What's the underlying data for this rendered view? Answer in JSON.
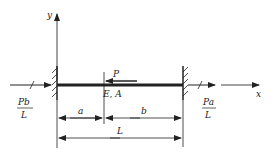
{
  "diagram": {
    "type": "axially loaded bar fixed at both ends",
    "axes": {
      "x_label": "x",
      "y_label": "y"
    },
    "bar": {
      "properties_label": "E, A"
    },
    "load": {
      "label": "P",
      "direction": "left"
    },
    "reactions": {
      "left": {
        "numerator": "Pb",
        "denominator": "L"
      },
      "right": {
        "numerator": "Pa",
        "denominator": "L"
      }
    },
    "dimensions": {
      "a": "a",
      "b": "b",
      "L": "L"
    },
    "colors": {
      "line": "#222222",
      "background": "#ffffff"
    }
  }
}
